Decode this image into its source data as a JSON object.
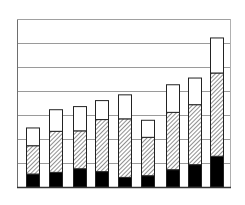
{
  "chart_data": {
    "type": "bar",
    "stacked": true,
    "title": "",
    "xlabel": "",
    "ylabel": "",
    "categories": [
      "1",
      "2",
      "3",
      "4",
      "5",
      "6",
      "7",
      "8",
      "9"
    ],
    "series": [
      {
        "name": "Bottom (solid black)",
        "pattern": "solid",
        "color": "#000000",
        "values": [
          0.54,
          0.61,
          0.76,
          0.64,
          0.4,
          0.47,
          0.72,
          0.93,
          1.28
        ]
      },
      {
        "name": "Middle (diagonal hatch)",
        "pattern": "hatch",
        "color": "#555555",
        "values": [
          1.18,
          1.71,
          1.58,
          2.17,
          2.44,
          1.6,
          2.39,
          2.5,
          3.47
        ]
      },
      {
        "name": "Top (white)",
        "pattern": "none",
        "color": "#ffffff",
        "values": [
          0.74,
          0.9,
          1.01,
          0.79,
          1.0,
          0.71,
          1.15,
          1.11,
          1.46
        ]
      }
    ],
    "totals": [
      2.46,
      3.22,
      3.36,
      3.6,
      3.85,
      2.78,
      4.26,
      4.54,
      6.21
    ],
    "ylim": [
      0,
      7
    ],
    "gridlines": [
      1,
      2,
      3,
      4,
      5,
      6
    ],
    "grid": true,
    "tick_labels_shown": false,
    "legend": null
  },
  "layout": {
    "plot_left": 17,
    "plot_right": 230,
    "plot_top": 19,
    "plot_bottom": 187,
    "bar_x": [
      26,
      49,
      73,
      95,
      118,
      141,
      166,
      188,
      210
    ],
    "bar_width": 13,
    "grid_color": "#9a9a9a",
    "axis_color": "#6e6e6e",
    "bar_outline": "#222222"
  }
}
